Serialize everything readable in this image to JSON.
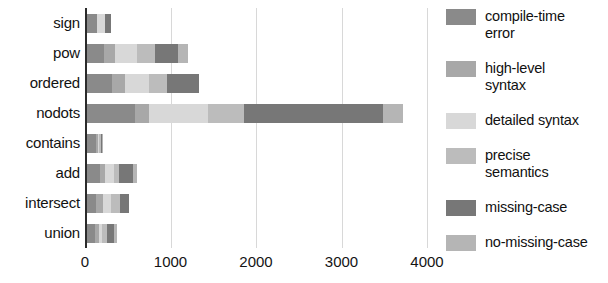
{
  "chart_data": {
    "type": "bar",
    "orientation": "horizontal",
    "stacked": true,
    "title": "",
    "xlabel": "",
    "ylabel": "",
    "xlim": [
      0,
      4000
    ],
    "xticks": [
      0,
      1000,
      2000,
      3000,
      4000
    ],
    "xtick_labels": [
      "0",
      "1000",
      "2000",
      "3000",
      "4000"
    ],
    "grid": true,
    "grid_axis": "x",
    "legend_position": "right",
    "categories": [
      "sign",
      "pow",
      "ordered",
      "nodots",
      "contains",
      "add",
      "intersect",
      "union"
    ],
    "series": [
      {
        "name": "compile-time error",
        "color": "#8a8a8a",
        "values": [
          120,
          200,
          290,
          560,
          100,
          150,
          110,
          90
        ]
      },
      {
        "name": "high-level syntax",
        "color": "#a8a8a8",
        "values": [
          0,
          130,
          150,
          160,
          30,
          60,
          80,
          50
        ]
      },
      {
        "name": "detailed syntax",
        "color": "#d8d8d8",
        "values": [
          90,
          260,
          280,
          700,
          10,
          110,
          90,
          30
        ]
      },
      {
        "name": "precise semantics",
        "color": "#bcbcbc",
        "values": [
          0,
          210,
          210,
          420,
          20,
          60,
          110,
          60
        ]
      },
      {
        "name": "missing-case",
        "color": "#777777",
        "values": [
          70,
          260,
          380,
          1620,
          20,
          160,
          100,
          90
        ]
      },
      {
        "name": "no-missing-case",
        "color": "#b5b5b5",
        "values": [
          0,
          120,
          0,
          240,
          10,
          40,
          0,
          30
        ]
      }
    ],
    "totals": [
      280,
      1180,
      1310,
      3700,
      190,
      580,
      490,
      350
    ]
  },
  "legend": {
    "items": [
      {
        "label": "compile-time\nerror",
        "color": "#8a8a8a"
      },
      {
        "label": "high-level\nsyntax",
        "color": "#a8a8a8"
      },
      {
        "label": "detailed syntax",
        "color": "#d8d8d8"
      },
      {
        "label": "precise\nsemantics",
        "color": "#bcbcbc"
      },
      {
        "label": "missing-case",
        "color": "#777777"
      },
      {
        "label": "no-missing-case",
        "color": "#b5b5b5"
      }
    ]
  }
}
